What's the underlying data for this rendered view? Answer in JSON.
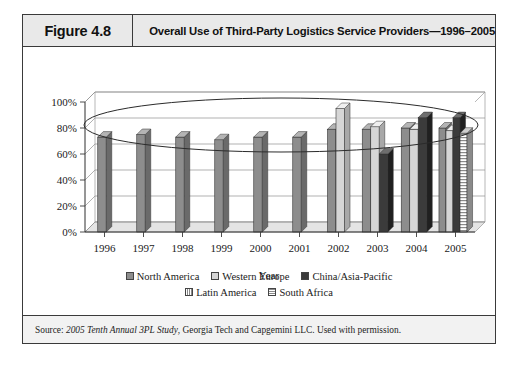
{
  "figure": {
    "label": "Figure 4.8",
    "title": "Overall Use of Third-Party Logistics Service Providers—1996–2005",
    "source_prefix": "Source: ",
    "source_italic": "2005 Tenth Annual 3PL Study",
    "source_rest": ", Georgia Tech and Capgemini LLC. Used with permission."
  },
  "legend": {
    "rows": [
      [
        {
          "label": "North America",
          "swatch": "sw-na",
          "icon": "legend-swatch-north-america"
        },
        {
          "label": "Western Europe",
          "swatch": "sw-we",
          "icon": "legend-swatch-western-europe"
        },
        {
          "label": "China/Asia-Pacific",
          "swatch": "sw-cn",
          "icon": "legend-swatch-china-asia-pacific"
        }
      ],
      [
        {
          "label": "Latin America",
          "swatch": "sw-la",
          "icon": "legend-swatch-latin-america"
        },
        {
          "label": "South Africa",
          "swatch": "sw-sa",
          "icon": "legend-swatch-south-africa"
        }
      ]
    ]
  },
  "annotation": {
    "shape": "ellipse-highlight",
    "description": "hand-drawn oval encircling the upper band of the plot"
  },
  "chart_data": {
    "type": "bar",
    "title": "Overall Use of Third-Party Logistics Service Providers—1996–2005",
    "xlabel": "Year",
    "ylabel": "",
    "ylim": [
      0,
      100
    ],
    "yticks": [
      0,
      20,
      40,
      60,
      80,
      100
    ],
    "ytick_labels": [
      "0%",
      "20%",
      "40%",
      "60%",
      "80%",
      "100%"
    ],
    "grid": true,
    "legend_position": "bottom",
    "value_unit": "%",
    "categories": [
      "1996",
      "1997",
      "1998",
      "1999",
      "2000",
      "2001",
      "2002",
      "2003",
      "2004",
      "2005"
    ],
    "series": [
      {
        "name": "North America",
        "color": "#8d8d8d",
        "values": [
          73,
          75,
          73,
          71,
          73,
          73,
          79,
          79,
          80,
          80
        ]
      },
      {
        "name": "Western Europe",
        "color": "#d6d6d6",
        "values": [
          null,
          null,
          null,
          null,
          null,
          null,
          95,
          81,
          79,
          78
        ]
      },
      {
        "name": "China/Asia-Pacific",
        "color": "#3b3b3b",
        "values": [
          null,
          null,
          null,
          null,
          null,
          null,
          null,
          60,
          88,
          88
        ]
      },
      {
        "name": "Latin America",
        "color": "#8a8a8a",
        "values": [
          null,
          null,
          null,
          null,
          null,
          null,
          null,
          null,
          null,
          null
        ]
      },
      {
        "name": "South Africa",
        "color": "#8a8a8a",
        "values": [
          null,
          null,
          null,
          null,
          null,
          null,
          null,
          null,
          null,
          76
        ]
      }
    ]
  }
}
